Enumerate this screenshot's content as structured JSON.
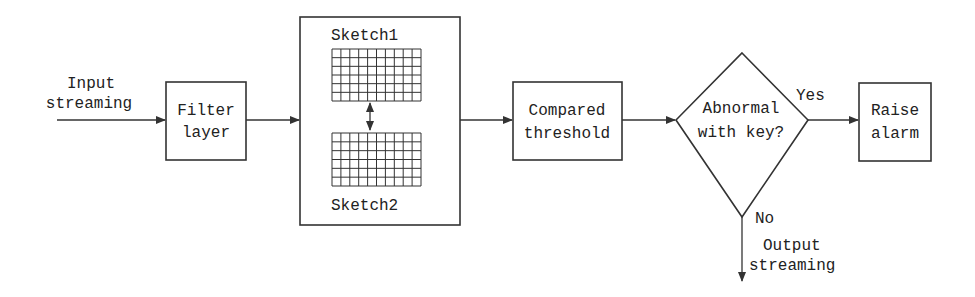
{
  "diagram": {
    "input": {
      "line1": "Input",
      "line2": "streaming"
    },
    "filter": {
      "line1": "Filter",
      "line2": "layer"
    },
    "sketch_group": {
      "sketch1": "Sketch1",
      "sketch2": "Sketch2",
      "grid_cols": 10,
      "grid_rows": 6
    },
    "compare": {
      "line1": "Compared",
      "line2": "threshold"
    },
    "decision": {
      "line1": "Abnormal",
      "line2": "with key?"
    },
    "yes_label": "Yes",
    "no_label": "No",
    "alarm": {
      "line1": "Raise",
      "line2": "alarm"
    },
    "output": {
      "line1": "Output",
      "line2": "streaming"
    },
    "colors": {
      "stroke": "#333333",
      "text": "#222222",
      "background": "#ffffff"
    }
  }
}
